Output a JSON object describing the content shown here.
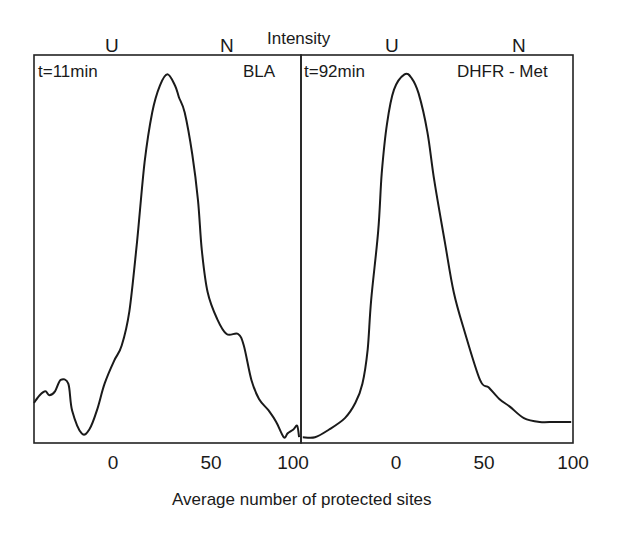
{
  "figure": {
    "y_axis_label": "Intensity",
    "x_axis_label": "Average number of protected sites"
  },
  "panels": [
    {
      "time_label": "t=11min",
      "protein_label": "BLA",
      "markers": [
        "U",
        "N"
      ],
      "ticks": [
        "0",
        "50",
        "100"
      ]
    },
    {
      "time_label": "t=92min",
      "protein_label": "DHFR - Met",
      "markers": [
        "U",
        "N"
      ],
      "ticks": [
        "0",
        "50",
        "100"
      ]
    }
  ],
  "chart_data": [
    {
      "type": "line",
      "title": "BLA",
      "annotation": "t=11min",
      "xlabel": "Average number of protected sites",
      "ylabel": "Intensity (arbitrary, normalized)",
      "xlim": [
        -40,
        100
      ],
      "ylim": [
        0,
        1
      ],
      "x_ticks": [
        0,
        50,
        100
      ],
      "top_markers": {
        "U": 0,
        "N": 60
      },
      "grid": false,
      "series": [
        {
          "name": "BLA t=11min",
          "x": [
            -40,
            -37,
            -34,
            -32,
            -29,
            -26,
            -22,
            -20,
            -15,
            -11,
            -7,
            -3,
            2,
            6,
            10,
            14,
            18,
            22,
            26,
            30,
            34,
            36,
            39,
            43,
            46,
            48,
            51,
            56,
            61,
            67,
            70,
            74,
            78,
            83,
            87,
            91,
            93,
            96,
            98,
            99
          ],
          "y": [
            0.1,
            0.12,
            0.13,
            0.12,
            0.13,
            0.16,
            0.15,
            0.08,
            0.02,
            0.03,
            0.08,
            0.15,
            0.21,
            0.25,
            0.34,
            0.52,
            0.73,
            0.86,
            0.93,
            0.96,
            0.93,
            0.9,
            0.86,
            0.75,
            0.63,
            0.5,
            0.39,
            0.32,
            0.28,
            0.28,
            0.25,
            0.16,
            0.11,
            0.08,
            0.05,
            0.01,
            0.02,
            0.03,
            0.04,
            0.01
          ]
        }
      ]
    },
    {
      "type": "line",
      "title": "DHFR - Met",
      "annotation": "t=92min",
      "xlabel": "Average number of protected sites",
      "ylabel": "Intensity (arbitrary, normalized)",
      "xlim": [
        -55,
        100
      ],
      "ylim": [
        0,
        1
      ],
      "x_ticks": [
        0,
        50,
        100
      ],
      "top_markers": {
        "U": 0,
        "N": 75
      },
      "grid": false,
      "series": [
        {
          "name": "DHFR - Met t=92min",
          "x": [
            -54,
            -47,
            -39,
            -30,
            -24,
            -20,
            -17,
            -15,
            -11,
            -9,
            -6,
            -2,
            4,
            8,
            12,
            17,
            21,
            27,
            32,
            38,
            47,
            52,
            58,
            64,
            72,
            81,
            89,
            95,
            99
          ],
          "y": [
            0.01,
            0.01,
            0.03,
            0.06,
            0.1,
            0.15,
            0.24,
            0.37,
            0.55,
            0.7,
            0.83,
            0.92,
            0.96,
            0.95,
            0.91,
            0.81,
            0.68,
            0.52,
            0.39,
            0.29,
            0.16,
            0.14,
            0.11,
            0.09,
            0.06,
            0.05,
            0.05,
            0.05,
            0.05
          ]
        }
      ]
    }
  ]
}
